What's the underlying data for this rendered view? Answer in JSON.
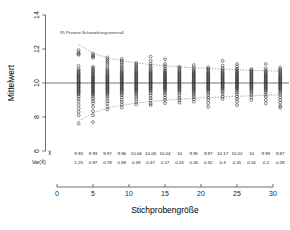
{
  "chart_data": {
    "type": "scatter",
    "title": "",
    "xlabel": "Stichprobengröße",
    "ylabel": "Mittelwert",
    "xlim": [
      -1.8,
      32.5
    ],
    "ylim": [
      6,
      14
    ],
    "xticks": [
      0,
      5,
      10,
      15,
      20,
      25,
      30
    ],
    "yticks": [
      6,
      8,
      10,
      12,
      14
    ],
    "grid": false,
    "legend_position": "none",
    "annotation": "95 Prozent Schwankungsintervall",
    "reference_line": {
      "y": 10,
      "color": "#555555"
    },
    "band_color": "#8a8a8a",
    "marker": "open-circle",
    "marker_color": "#222222",
    "sample_sizes": [
      3,
      5,
      7,
      9,
      11,
      13,
      15,
      17,
      19,
      21,
      23,
      25,
      27,
      29,
      31
    ],
    "mean_row_label": "X̄",
    "var_row_label": "Var(X̄)",
    "means": [
      9.93,
      9.93,
      9.97,
      9.96,
      10.06,
      10.06,
      10.04,
      10,
      9.95,
      9.97,
      10.17,
      10.02,
      10,
      9.93,
      9.87
    ],
    "variances": [
      1.25,
      0.97,
      0.78,
      0.69,
      0.39,
      0.47,
      0.17,
      0.24,
      0.26,
      0.32,
      0.3,
      0.31,
      0.16,
      0.2,
      0.28
    ],
    "interval_upper": [
      12.26,
      11.75,
      11.48,
      11.31,
      11.18,
      11.09,
      11.01,
      10.95,
      10.9,
      10.86,
      10.82,
      10.78,
      10.75,
      10.72,
      10.7
    ],
    "interval_lower": [
      7.74,
      8.25,
      8.52,
      8.69,
      8.82,
      8.91,
      8.99,
      9.05,
      9.1,
      9.14,
      9.18,
      9.22,
      9.25,
      9.28,
      9.3
    ],
    "series": [
      {
        "n": 3,
        "values": [
          11.93,
          11.78,
          11.72,
          11.66,
          11.0,
          10.82,
          10.73,
          10.66,
          10.6,
          10.52,
          10.46,
          10.4,
          10.34,
          10.28,
          10.22,
          10.16,
          10.1,
          10.04,
          9.98,
          9.92,
          9.86,
          9.8,
          9.74,
          9.68,
          9.62,
          9.56,
          9.5,
          9.44,
          9.38,
          9.32,
          9.2,
          9.05,
          8.9,
          8.7,
          8.5,
          8.3,
          8.1,
          7.62
        ]
      },
      {
        "n": 5,
        "values": [
          11.72,
          11.62,
          11.56,
          11.48,
          10.95,
          10.86,
          10.78,
          10.7,
          10.62,
          10.54,
          10.46,
          10.4,
          10.34,
          10.28,
          10.22,
          10.16,
          10.1,
          10.04,
          9.98,
          9.92,
          9.86,
          9.8,
          9.74,
          9.68,
          9.62,
          9.56,
          9.5,
          9.44,
          9.38,
          9.3,
          9.2,
          9.08,
          8.95,
          8.8,
          8.6,
          8.35,
          8.1,
          7.7
        ]
      },
      {
        "n": 7,
        "values": [
          11.5,
          11.38,
          11.28,
          11.18,
          11.05,
          10.9,
          10.8,
          10.72,
          10.64,
          10.56,
          10.48,
          10.42,
          10.36,
          10.3,
          10.24,
          10.18,
          10.12,
          10.06,
          10.0,
          9.94,
          9.88,
          9.82,
          9.76,
          9.7,
          9.64,
          9.58,
          9.52,
          9.46,
          9.4,
          9.32,
          9.22,
          9.1,
          8.95,
          8.8,
          8.62,
          8.45
        ]
      },
      {
        "n": 9,
        "values": [
          11.42,
          11.3,
          11.2,
          11.1,
          10.98,
          10.88,
          10.78,
          10.7,
          10.62,
          10.56,
          10.5,
          10.44,
          10.38,
          10.32,
          10.26,
          10.2,
          10.14,
          10.08,
          10.02,
          9.96,
          9.9,
          9.84,
          9.78,
          9.72,
          9.66,
          9.6,
          9.54,
          9.46,
          9.38,
          9.28,
          9.16,
          9.02,
          8.88,
          8.72,
          8.55
        ]
      },
      {
        "n": 11,
        "values": [
          11.18,
          11.08,
          11.0,
          10.92,
          10.84,
          10.76,
          10.68,
          10.62,
          10.56,
          10.5,
          10.44,
          10.38,
          10.32,
          10.26,
          10.2,
          10.14,
          10.08,
          10.02,
          9.96,
          9.9,
          9.84,
          9.78,
          9.72,
          9.66,
          9.6,
          9.54,
          9.48,
          9.4,
          9.3,
          9.18,
          9.05,
          8.9,
          8.75
        ]
      },
      {
        "n": 13,
        "values": [
          11.55,
          11.3,
          11.12,
          11.0,
          10.9,
          10.8,
          10.72,
          10.64,
          10.58,
          10.52,
          10.46,
          10.4,
          10.34,
          10.28,
          10.22,
          10.16,
          10.1,
          10.04,
          9.98,
          9.92,
          9.86,
          9.8,
          9.74,
          9.68,
          9.62,
          9.56,
          9.48,
          9.38,
          9.26,
          9.12,
          8.98,
          8.8,
          8.7
        ]
      },
      {
        "n": 15,
        "values": [
          11.4,
          11.12,
          10.98,
          10.86,
          10.76,
          10.68,
          10.6,
          10.54,
          10.48,
          10.42,
          10.36,
          10.3,
          10.24,
          10.18,
          10.12,
          10.06,
          10.0,
          9.94,
          9.88,
          9.82,
          9.76,
          9.7,
          9.64,
          9.58,
          9.5,
          9.4,
          9.28,
          9.14,
          9.0,
          8.82
        ]
      },
      {
        "n": 17,
        "values": [
          10.96,
          10.88,
          10.8,
          10.72,
          10.64,
          10.58,
          10.52,
          10.46,
          10.4,
          10.34,
          10.28,
          10.22,
          10.16,
          10.1,
          10.04,
          9.98,
          9.92,
          9.86,
          9.8,
          9.74,
          9.68,
          9.62,
          9.56,
          9.48,
          9.38,
          9.26,
          9.12,
          8.98,
          8.85
        ]
      },
      {
        "n": 19,
        "values": [
          11.05,
          10.9,
          10.8,
          10.72,
          10.64,
          10.58,
          10.52,
          10.46,
          10.4,
          10.34,
          10.28,
          10.22,
          10.16,
          10.1,
          10.04,
          9.98,
          9.92,
          9.86,
          9.8,
          9.74,
          9.68,
          9.62,
          9.56,
          9.48,
          9.4,
          9.3,
          9.18,
          9.05,
          8.9
        ]
      },
      {
        "n": 21,
        "values": [
          10.92,
          10.84,
          10.76,
          10.68,
          10.6,
          10.54,
          10.48,
          10.42,
          10.36,
          10.3,
          10.24,
          10.18,
          10.12,
          10.06,
          10.0,
          9.94,
          9.88,
          9.82,
          9.76,
          9.7,
          9.64,
          9.58,
          9.5,
          9.4,
          9.28,
          9.14,
          9.0,
          8.82,
          8.6
        ]
      },
      {
        "n": 23,
        "values": [
          11.3,
          11.02,
          10.86,
          10.76,
          10.68,
          10.6,
          10.54,
          10.48,
          10.42,
          10.36,
          10.3,
          10.24,
          10.18,
          10.12,
          10.06,
          10.0,
          9.94,
          9.88,
          9.82,
          9.76,
          9.7,
          9.64,
          9.56,
          9.46,
          9.34,
          9.2,
          9.06
        ]
      },
      {
        "n": 25,
        "values": [
          11.12,
          10.96,
          10.84,
          10.76,
          10.68,
          10.6,
          10.54,
          10.48,
          10.42,
          10.36,
          10.3,
          10.24,
          10.18,
          10.12,
          10.06,
          10.0,
          9.94,
          9.88,
          9.82,
          9.76,
          9.7,
          9.64,
          9.56,
          9.46,
          9.34,
          9.2,
          9.06,
          8.9,
          8.7
        ]
      },
      {
        "n": 27,
        "values": [
          10.82,
          10.74,
          10.68,
          10.62,
          10.56,
          10.5,
          10.44,
          10.38,
          10.32,
          10.26,
          10.2,
          10.14,
          10.08,
          10.02,
          9.96,
          9.9,
          9.84,
          9.78,
          9.72,
          9.66,
          9.6,
          9.52,
          9.42,
          9.3,
          9.16,
          9.0
        ]
      },
      {
        "n": 29,
        "values": [
          11.12,
          10.86,
          10.74,
          10.66,
          10.58,
          10.52,
          10.46,
          10.4,
          10.34,
          10.28,
          10.22,
          10.16,
          10.1,
          10.04,
          9.98,
          9.92,
          9.86,
          9.8,
          9.74,
          9.68,
          9.62,
          9.54,
          9.44,
          9.32,
          9.18,
          9.0,
          8.8
        ]
      },
      {
        "n": 31,
        "values": [
          10.9,
          10.8,
          10.72,
          10.64,
          10.56,
          10.5,
          10.44,
          10.38,
          10.32,
          10.26,
          10.2,
          10.14,
          10.08,
          10.02,
          9.96,
          9.9,
          9.84,
          9.78,
          9.72,
          9.66,
          9.6,
          9.52,
          9.42,
          9.3,
          9.16,
          9.0,
          8.85,
          8.65,
          8.55
        ]
      }
    ]
  }
}
